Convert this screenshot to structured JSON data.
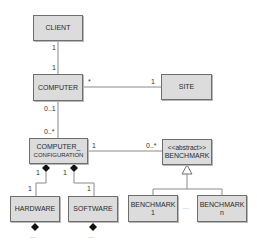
{
  "diagram": {
    "type": "UML class diagram",
    "classes": {
      "client": {
        "name": "CLIENT"
      },
      "computer": {
        "name": "COMPUTER"
      },
      "site": {
        "name": "SITE"
      },
      "computer_configuration": {
        "line1": "COMPUTER_",
        "line2": "CONFIGURATION"
      },
      "benchmark": {
        "stereotype": "<<abstract>>",
        "name": "BENCHMARK"
      },
      "hardware": {
        "name": "HARDWARE"
      },
      "software": {
        "name": "SOFTWARE"
      },
      "benchmark_1": {
        "line1": "BENCHMARK",
        "line2": "1"
      },
      "benchmark_n": {
        "line1": "BENCHMARK",
        "line2": "n"
      }
    },
    "multiplicities": {
      "client_computer_top": "1",
      "client_computer_bottom": "1",
      "computer_site_left": "*",
      "computer_site_right": "1",
      "computer_config_top": "0..1",
      "computer_config_bottom": "0..*",
      "config_benchmark_left": "1",
      "config_benchmark_right": "0..*",
      "config_hardware_top": "1",
      "config_hardware_bottom": "1",
      "config_software_top": "1",
      "config_software_bottom": "1"
    },
    "ellipses": {
      "benchmarks": "...",
      "hardware_more": "...",
      "software_more": "..."
    },
    "colors": {
      "box_fill": "#dcdcdc",
      "box_border": "#6e6e6e",
      "line": "#8a8a8a",
      "diamond": "#111111",
      "text": "#2a2a2a"
    }
  }
}
